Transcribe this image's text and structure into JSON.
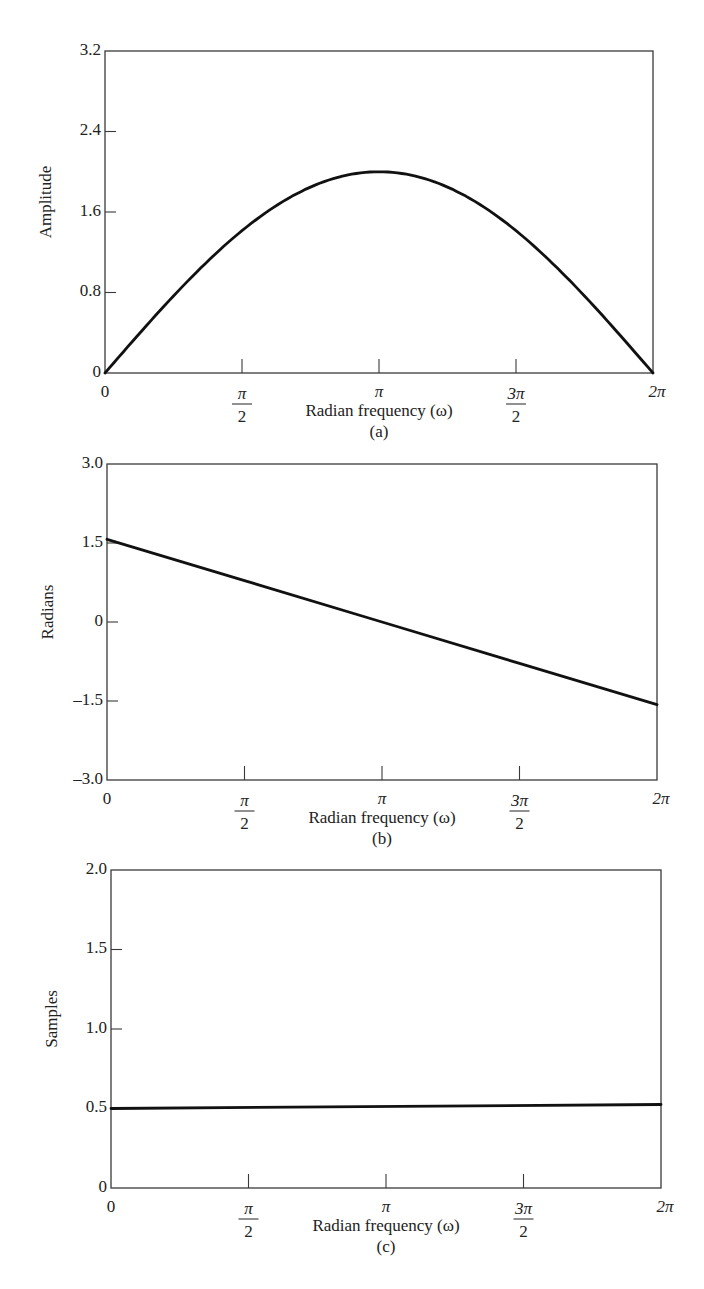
{
  "chart_data": [
    {
      "id": "a",
      "type": "line",
      "caption": "(a)",
      "title": "",
      "xlabel": "Radian frequency (ω)",
      "ylabel": "Amplitude",
      "xlim": [
        0,
        6.2832
      ],
      "ylim": [
        0,
        3.2
      ],
      "x_ticks": [
        {
          "value": 0,
          "label": "0"
        },
        {
          "value": 1.5708,
          "label_num": "π",
          "label_den": "2"
        },
        {
          "value": 3.1416,
          "label": "π"
        },
        {
          "value": 4.7124,
          "label_num": "3π",
          "label_den": "2"
        },
        {
          "value": 6.2832,
          "label": "2π"
        }
      ],
      "y_ticks": [
        {
          "value": 0,
          "label": "0"
        },
        {
          "value": 0.8,
          "label": "0.8"
        },
        {
          "value": 1.6,
          "label": "1.6"
        },
        {
          "value": 2.4,
          "label": "2.4"
        },
        {
          "value": 3.2,
          "label": "3.2"
        }
      ],
      "grid": false,
      "series": [
        {
          "name": "magnitude",
          "description": "2·sin(ω/2)",
          "x": [
            0,
            0.3927,
            0.7854,
            1.1781,
            1.5708,
            1.9635,
            2.3562,
            2.7489,
            3.1416,
            3.5343,
            3.927,
            4.3197,
            4.7124,
            5.1051,
            5.4978,
            5.8905,
            6.2832
          ],
          "y": [
            0,
            0.392,
            0.765,
            1.111,
            1.414,
            1.663,
            1.848,
            1.962,
            2.0,
            1.962,
            1.848,
            1.663,
            1.414,
            1.111,
            0.765,
            0.392,
            0
          ]
        }
      ],
      "frame_px": {
        "left": 105,
        "top": 51,
        "right": 653,
        "bottom": 373
      }
    },
    {
      "id": "b",
      "type": "line",
      "caption": "(b)",
      "title": "",
      "xlabel": "Radian frequency (ω)",
      "ylabel": "Radians",
      "xlim": [
        0,
        6.2832
      ],
      "ylim": [
        -3.0,
        3.0
      ],
      "x_ticks": [
        {
          "value": 0,
          "label": "0"
        },
        {
          "value": 1.5708,
          "label_num": "π",
          "label_den": "2"
        },
        {
          "value": 3.1416,
          "label": "π"
        },
        {
          "value": 4.7124,
          "label_num": "3π",
          "label_den": "2"
        },
        {
          "value": 6.2832,
          "label": "2π"
        }
      ],
      "y_ticks": [
        {
          "value": -3.0,
          "label": "–3.0"
        },
        {
          "value": -1.5,
          "label": "–1.5"
        },
        {
          "value": 0,
          "label": "0"
        },
        {
          "value": 1.5,
          "label": "1.5"
        },
        {
          "value": 3.0,
          "label": "3.0"
        }
      ],
      "grid": false,
      "series": [
        {
          "name": "phase",
          "description": "π/2 − ω/2",
          "x": [
            0,
            1.5708,
            3.1416,
            4.7124,
            6.2832
          ],
          "y": [
            1.5708,
            0.7854,
            0,
            -0.7854,
            -1.5708
          ]
        }
      ],
      "frame_px": {
        "left": 107,
        "top": 464,
        "right": 657,
        "bottom": 780
      }
    },
    {
      "id": "c",
      "type": "line",
      "caption": "(c)",
      "title": "",
      "xlabel": "Radian frequency (ω)",
      "ylabel": "Samples",
      "xlim": [
        0,
        6.2832
      ],
      "ylim": [
        0,
        2.0
      ],
      "x_ticks": [
        {
          "value": 0,
          "label": "0"
        },
        {
          "value": 1.5708,
          "label_num": "π",
          "label_den": "2"
        },
        {
          "value": 3.1416,
          "label": "π"
        },
        {
          "value": 4.7124,
          "label_num": "3π",
          "label_den": "2"
        },
        {
          "value": 6.2832,
          "label": "2π"
        }
      ],
      "y_ticks": [
        {
          "value": 0,
          "label": "0"
        },
        {
          "value": 0.5,
          "label": "0.5"
        },
        {
          "value": 1.0,
          "label": "1.0"
        },
        {
          "value": 1.5,
          "label": "1.5"
        },
        {
          "value": 2.0,
          "label": "2.0"
        }
      ],
      "grid": false,
      "series": [
        {
          "name": "group delay",
          "description": "constant 0.5 samples",
          "x": [
            0,
            6.2832
          ],
          "y": [
            0.5,
            0.5
          ]
        }
      ],
      "frame_px": {
        "left": 111,
        "top": 870,
        "right": 661,
        "bottom": 1188
      }
    }
  ]
}
